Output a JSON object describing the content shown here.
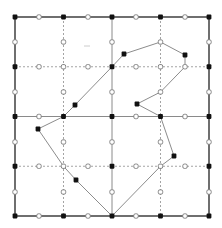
{
  "diagram": {
    "type": "grid-polygon",
    "canvas": {
      "width": 222,
      "height": 228
    },
    "colors": {
      "background": "#ffffff",
      "border": "#333333",
      "solid_line": "#8a8a8a",
      "dotted_line": "#9a9a9a",
      "polygon": "#8c8c8c",
      "filled_node": "#111111",
      "hollow_node_fill": "#ffffff",
      "hollow_node_stroke": "#777777"
    },
    "grid": {
      "x": [
        15,
        63.5,
        112,
        160.5,
        209
      ],
      "y": [
        17,
        66.75,
        116.5,
        166.25,
        216
      ],
      "border": {
        "x0": 15,
        "y0": 17,
        "x1": 209,
        "y1": 216
      },
      "solid_lines": [
        {
          "x1": 112,
          "y1": 17,
          "x2": 112,
          "y2": 216
        },
        {
          "x1": 15,
          "y1": 116.5,
          "x2": 209,
          "y2": 116.5
        }
      ],
      "dotted_lines": [
        {
          "x1": 63.5,
          "y1": 17,
          "x2": 63.5,
          "y2": 216
        },
        {
          "x1": 160.5,
          "y1": 17,
          "x2": 160.5,
          "y2": 216
        },
        {
          "x1": 15,
          "y1": 66.75,
          "x2": 209,
          "y2": 66.75
        },
        {
          "x1": 15,
          "y1": 166.25,
          "x2": 209,
          "y2": 166.25
        }
      ]
    },
    "filled_nodes": [
      [
        15,
        17
      ],
      [
        63.5,
        17
      ],
      [
        112,
        17
      ],
      [
        160.5,
        17
      ],
      [
        209,
        17
      ],
      [
        15,
        66.75
      ],
      [
        112,
        66.75
      ],
      [
        209,
        66.75
      ],
      [
        15,
        116.5
      ],
      [
        63.5,
        116.5
      ],
      [
        112,
        116.5
      ],
      [
        160.5,
        116.5
      ],
      [
        209,
        116.5
      ],
      [
        15,
        166.25
      ],
      [
        112,
        166.25
      ],
      [
        209,
        166.25
      ],
      [
        15,
        216
      ],
      [
        63.5,
        216
      ],
      [
        112,
        216
      ],
      [
        160.5,
        216
      ],
      [
        209,
        216
      ],
      [
        124,
        54
      ],
      [
        185,
        55
      ],
      [
        137,
        104
      ],
      [
        174,
        156
      ],
      [
        76,
        180
      ],
      [
        38,
        129
      ],
      [
        75,
        105
      ]
    ],
    "hollow_nodes": [
      [
        39,
        17
      ],
      [
        88,
        17
      ],
      [
        136,
        17
      ],
      [
        185,
        17
      ],
      [
        15,
        42
      ],
      [
        63.5,
        42
      ],
      [
        112,
        42
      ],
      [
        160.5,
        42
      ],
      [
        209,
        42
      ],
      [
        39,
        66.75
      ],
      [
        63.5,
        66.75
      ],
      [
        88,
        66.75
      ],
      [
        136,
        66.75
      ],
      [
        160.5,
        66.75
      ],
      [
        185,
        66.75
      ],
      [
        15,
        92
      ],
      [
        63.5,
        92
      ],
      [
        112,
        92
      ],
      [
        160.5,
        92
      ],
      [
        209,
        92
      ],
      [
        39,
        116.5
      ],
      [
        136,
        116.5
      ],
      [
        185,
        116.5
      ],
      [
        15,
        142
      ],
      [
        63.5,
        142
      ],
      [
        112,
        142
      ],
      [
        160.5,
        142
      ],
      [
        209,
        142
      ],
      [
        39,
        166.25
      ],
      [
        63.5,
        166.25
      ],
      [
        88,
        166.25
      ],
      [
        136,
        166.25
      ],
      [
        160.5,
        166.25
      ],
      [
        185,
        166.25
      ],
      [
        15,
        192
      ],
      [
        63.5,
        192
      ],
      [
        112,
        192
      ],
      [
        160.5,
        192
      ],
      [
        209,
        192
      ],
      [
        39,
        216
      ],
      [
        88,
        216
      ],
      [
        136,
        216
      ],
      [
        185,
        216
      ]
    ],
    "polygon": [
      [
        112,
        66.75
      ],
      [
        124,
        54
      ],
      [
        160.5,
        42
      ],
      [
        185,
        55
      ],
      [
        185,
        66.75
      ],
      [
        160.5,
        92
      ],
      [
        137,
        104
      ],
      [
        160.5,
        116.5
      ],
      [
        174,
        156
      ],
      [
        160.5,
        166.25
      ],
      [
        112,
        216
      ],
      [
        76,
        180
      ],
      [
        63.5,
        166.25
      ],
      [
        38,
        129
      ],
      [
        63.5,
        116.5
      ],
      [
        75,
        105
      ]
    ],
    "marks": [
      {
        "x1": 84,
        "y1": 46,
        "x2": 90,
        "y2": 46
      }
    ]
  }
}
